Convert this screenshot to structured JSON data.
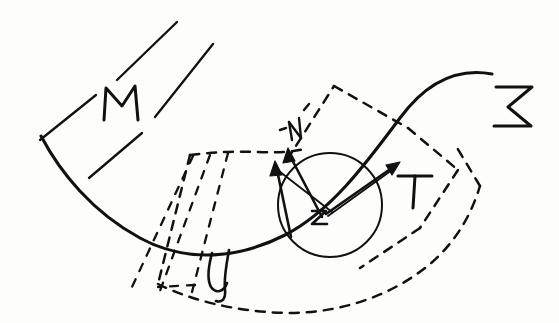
{
  "figure": {
    "kind": "hand-drawn-diagram",
    "background_color": "#fdfdfc",
    "ink_color": "#111111",
    "width": 559,
    "height": 323
  },
  "labels": {
    "ambient_manifold": "M",
    "hypersurface": "Σ",
    "neighborhood": "𝒰",
    "point": "z",
    "normal_vector": "N",
    "tangent_vector": "T"
  },
  "elements": {
    "manifold_band": {
      "name": "M",
      "description": "parallel ruled lines indicating ambient manifold",
      "line_count": 4,
      "style": "solid"
    },
    "hypersurface_curve": {
      "name": "Σ",
      "description": "main solid curve sweeping left-down then right-up",
      "style": "solid"
    },
    "neighborhood_region": {
      "name": "𝒰",
      "description": "dashed tubular region surrounding the curve",
      "style": "dashed"
    },
    "chart_patch": {
      "description": "dashed quadrilateral coordinate patch over the point",
      "style": "dashed"
    },
    "ball": {
      "description": "solid circle (metric ball) centred on the point z",
      "center": [
        330,
        205
      ],
      "radius": 52,
      "style": "solid"
    },
    "vectors": [
      {
        "label": "N",
        "role": "normal",
        "direction": "up-left"
      },
      {
        "label": "N",
        "role": "normal-secondary",
        "direction": "up"
      },
      {
        "label": "T",
        "role": "tangent",
        "direction": "up-right"
      }
    ],
    "fan_lines": {
      "description": "dashed fan of transversal lines crossing the curve",
      "count": 4,
      "style": "dashed"
    }
  }
}
